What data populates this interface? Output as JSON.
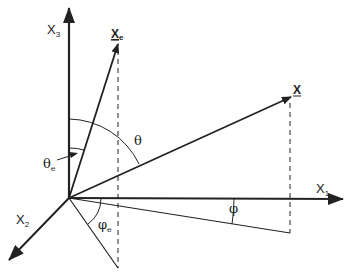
{
  "diagram": {
    "colors": {
      "line": "#222222",
      "background": "#ffffff"
    },
    "axes": {
      "x1": {
        "label": "X",
        "subscript": "1"
      },
      "x2": {
        "label": "X",
        "subscript": "2"
      },
      "x3": {
        "label": "X",
        "subscript": "3"
      }
    },
    "vectors": {
      "x": {
        "label": "X",
        "underlined": true
      },
      "xe": {
        "label": "X",
        "subscript": "e",
        "underlined": true
      }
    },
    "angles": {
      "theta": {
        "label": "θ"
      },
      "theta_e": {
        "label": "θ",
        "subscript": "e"
      },
      "phi": {
        "label": "φ"
      },
      "phi_e": {
        "label": "φ",
        "subscript": "e"
      }
    }
  }
}
